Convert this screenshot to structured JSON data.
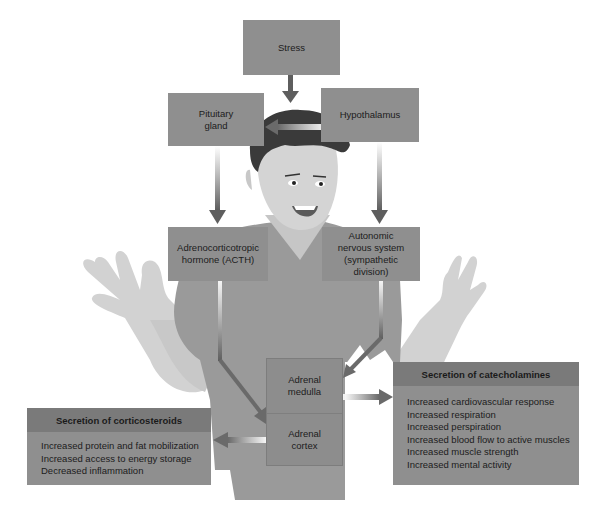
{
  "diagram": {
    "nodes": {
      "stress": {
        "label": "Stress"
      },
      "pituitary": {
        "lines": [
          "Pituitary",
          "gland"
        ]
      },
      "hypothalamus": {
        "label": "Hypothalamus"
      },
      "acth": {
        "lines": [
          "Adrenocorticotropic",
          "hormone (ACTH)"
        ]
      },
      "autonomic": {
        "lines": [
          "Autonomic",
          "nervous system",
          "(sympathetic division)"
        ]
      },
      "adrenal_medulla": {
        "lines": [
          "Adrenal",
          "medulla"
        ]
      },
      "adrenal_cortex": {
        "lines": [
          "Adrenal",
          "cortex"
        ]
      }
    },
    "panels": {
      "corticosteroids": {
        "title": "Secretion of corticosteroids",
        "items": [
          "Increased protein and fat mobilization",
          "Increased access to energy storage",
          "Decreased inflammation"
        ]
      },
      "catecholamines": {
        "title": "Secretion of catecholamines",
        "items": [
          "Increased cardiovascular response",
          "Increased respiration",
          "Increased perspiration",
          "Increased blood flow to active muscles",
          "Increased muscle strength",
          "Increased mental activity"
        ]
      }
    },
    "edges": [
      {
        "from": "Stress",
        "to": "Hypothalamus area"
      },
      {
        "from": "Hypothalamus",
        "to": "Pituitary gland"
      },
      {
        "from": "Pituitary gland",
        "to": "Adrenocorticotropic hormone (ACTH)"
      },
      {
        "from": "Hypothalamus",
        "to": "Autonomic nervous system (sympathetic division)"
      },
      {
        "from": "Adrenocorticotropic hormone (ACTH)",
        "to": "Adrenal cortex"
      },
      {
        "from": "Autonomic nervous system (sympathetic division)",
        "to": "Adrenal medulla"
      },
      {
        "from": "Adrenal medulla",
        "to": "Secretion of catecholamines"
      },
      {
        "from": "Adrenal cortex",
        "to": "Secretion of corticosteroids"
      }
    ],
    "colors": {
      "box_fill": "#8f8f8f",
      "panel_header": "#7a7a7a",
      "arrow": "#5e5e5e",
      "shirt": "#9a9a9a",
      "skin": "#cfcfcf",
      "hair": "#3a3a3a"
    }
  }
}
